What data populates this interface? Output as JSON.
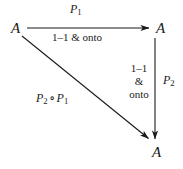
{
  "diagram": {
    "type": "commutative-triangle",
    "background_color": "#ffffff",
    "ink_color": "#1a1a1a",
    "nodes": [
      {
        "id": "a-left",
        "label": "A",
        "x": 16,
        "y": 28
      },
      {
        "id": "a-right",
        "label": "A",
        "x": 161,
        "y": 28
      },
      {
        "id": "a-bottom",
        "label": "A",
        "x": 157,
        "y": 152
      }
    ],
    "arrows": [
      {
        "id": "top-horizontal",
        "from": "a-left",
        "to": "a-right",
        "x1": 27,
        "y1": 28,
        "x2": 151,
        "y2": 28,
        "above_label": "P_1",
        "below_label": "1-1 & onto"
      },
      {
        "id": "right-vertical",
        "from": "a-right",
        "to": "a-bottom",
        "x1": 155,
        "y1": 38,
        "x2": 155,
        "y2": 141,
        "right_label": "P_2",
        "left_label": "1-1 & onto"
      },
      {
        "id": "diagonal",
        "from": "a-left",
        "to": "a-bottom",
        "x1": 22,
        "y1": 36,
        "x2": 150,
        "y2": 140,
        "label": "P_2 o P_1"
      }
    ],
    "labels": {
      "p1": {
        "base": "P",
        "sub": "1"
      },
      "p2": {
        "base": "P",
        "sub": "2"
      },
      "composition": {
        "first": {
          "base": "P",
          "sub": "2"
        },
        "operator": "∘",
        "second": {
          "base": "P",
          "sub": "1"
        }
      },
      "onto_top": "1–1 & onto",
      "onto_right_line1": "1–1",
      "onto_right_line2": "&",
      "onto_right_line3": "onto"
    }
  }
}
